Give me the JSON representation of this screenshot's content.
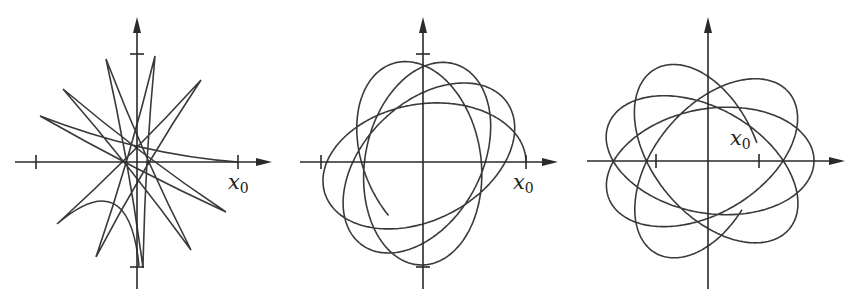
{
  "figure": {
    "stroke_color": "#3a3a3a",
    "axis_color": "#2a2a2a",
    "panels": [
      {
        "id": "panel-1",
        "label": "x",
        "label_sub": "0",
        "origin": [
          137,
          162
        ],
        "x_axis": [
          15,
          272
        ],
        "y_axis": [
          17,
          289
        ],
        "x_ticks": [
          36,
          238
        ],
        "y_ticks": [
          54,
          267
        ],
        "label_pos": [
          228,
          172
        ],
        "curve": {
          "type": "spikes",
          "points": [
            [
              238,
              162
            ],
            [
              40,
              116
            ],
            [
              226,
              212
            ],
            [
              63,
              89
            ],
            [
              191,
              250
            ],
            [
              106,
              59
            ],
            [
              143,
              268
            ],
            [
              155,
              56
            ],
            [
              96,
              257
            ],
            [
              201,
              80
            ],
            [
              57,
              224
            ],
            [
              139,
              266
            ]
          ]
        }
      },
      {
        "id": "panel-2",
        "label": "x",
        "label_sub": "0",
        "origin": [
          423,
          162
        ],
        "x_axis": [
          300,
          558
        ],
        "y_axis": [
          17,
          289
        ],
        "x_ticks": [
          321,
          526
        ],
        "y_ticks": [
          54,
          267
        ],
        "label_pos": [
          513,
          172
        ],
        "curve": {
          "type": "rosette",
          "a": 103,
          "b": 58,
          "start_angle": 0.0,
          "precession_per_turn": 0.62,
          "turns": 3.3
        }
      },
      {
        "id": "panel-3",
        "label": "x",
        "label_sub": "0",
        "origin": [
          708,
          161
        ],
        "x_axis": [
          587,
          845
        ],
        "y_axis": [
          17,
          289
        ],
        "x_ticks": [
          656,
          759
        ],
        "y_ticks": [],
        "label_pos": [
          730,
          128
        ],
        "curve": {
          "type": "rosette",
          "a": 106,
          "b": 56,
          "start_angle": 0.35,
          "precession_per_turn": 0.7,
          "turns": 3.45,
          "start_inner": true
        }
      }
    ]
  }
}
